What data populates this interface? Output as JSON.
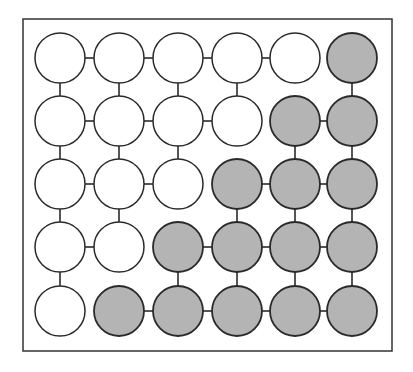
{
  "diagram": {
    "type": "grid-graph",
    "rows": 5,
    "cols": 6,
    "colors": {
      "background": "#ffffff",
      "frame": "#333333",
      "node_stroke": "#2a2a2a",
      "node_white": "#ffffff",
      "node_gray": "#b4b4b4",
      "edge": "#2a2a2a"
    },
    "frame": {
      "x": 23,
      "y": 19,
      "width": 369,
      "height": 332
    },
    "node_radius": 25,
    "col_x": [
      60,
      119,
      178,
      237,
      295,
      352
    ],
    "row_y": [
      58,
      121,
      184,
      247,
      311
    ],
    "nodes": [
      [
        "white",
        "white",
        "white",
        "white",
        "white",
        "gray"
      ],
      [
        "white",
        "white",
        "white",
        "white",
        "gray",
        "gray"
      ],
      [
        "white",
        "white",
        "white",
        "gray",
        "gray",
        "gray"
      ],
      [
        "white",
        "white",
        "gray",
        "gray",
        "gray",
        "gray"
      ],
      [
        "white",
        "gray",
        "gray",
        "gray",
        "gray",
        "gray"
      ]
    ],
    "horizontal_edges": [
      [
        true,
        true,
        true,
        true,
        false
      ],
      [
        true,
        true,
        true,
        false,
        true
      ],
      [
        true,
        true,
        false,
        true,
        true
      ],
      [
        true,
        false,
        true,
        true,
        true
      ],
      [
        false,
        true,
        true,
        true,
        true
      ]
    ],
    "vertical_edges": [
      [
        true,
        true,
        true,
        true,
        false,
        true
      ],
      [
        true,
        true,
        true,
        false,
        true,
        true
      ],
      [
        true,
        true,
        false,
        true,
        true,
        true
      ],
      [
        true,
        false,
        true,
        true,
        true,
        true
      ]
    ]
  }
}
